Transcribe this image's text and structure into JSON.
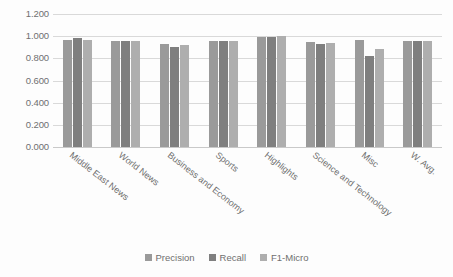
{
  "chart_data": {
    "type": "bar",
    "title": "",
    "subtitle": "",
    "xlabel": "",
    "ylabel": "",
    "ylim": [
      0.0,
      1.2
    ],
    "yticks": [
      "0.000",
      "0.200",
      "0.400",
      "0.600",
      "0.800",
      "1.000",
      "1.200"
    ],
    "ytick_values": [
      0.0,
      0.2,
      0.4,
      0.6,
      0.8,
      1.0,
      1.2
    ],
    "grid": true,
    "legend_position": "bottom",
    "categories": [
      "Middle East News",
      "World News",
      "Business and Economy",
      "Sports",
      "Highlights",
      "Science and Technology",
      "Misc",
      "W. Avg."
    ],
    "series": [
      {
        "name": "Precision",
        "color": "#9a9a9a",
        "values": [
          0.97,
          0.96,
          0.93,
          0.96,
          0.99,
          0.95,
          0.97,
          0.96
        ]
      },
      {
        "name": "Recall",
        "color": "#7f7f7f",
        "values": [
          0.98,
          0.96,
          0.9,
          0.96,
          0.99,
          0.93,
          0.82,
          0.96
        ]
      },
      {
        "name": "F1-Micro",
        "color": "#aeaeae",
        "values": [
          0.97,
          0.96,
          0.92,
          0.96,
          1.0,
          0.94,
          0.88,
          0.96
        ]
      }
    ]
  }
}
